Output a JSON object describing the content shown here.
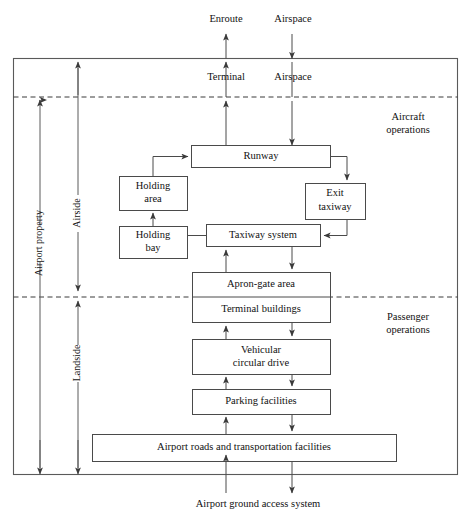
{
  "diagram": {
    "colors": {
      "line": "#4a4a4a",
      "frame": "#5a5a5a",
      "dashed": "#3a3a3a",
      "text": "#111111",
      "background": "#ffffff"
    },
    "external_labels": {
      "enroute": "Enroute",
      "airspace_top": "Airspace",
      "terminal": "Terminal",
      "airspace_terminal": "Airspace",
      "ground_access": "Airport ground access system"
    },
    "zone_labels": {
      "aircraft_operations_line1": "Aircraft",
      "aircraft_operations_line2": "operations",
      "passenger_operations_line1": "Passenger",
      "passenger_operations_line2": "operations"
    },
    "dimension_labels": {
      "airport_property": "Airport property",
      "airside": "Airside",
      "landside": "Landside"
    },
    "boxes": [
      {
        "id": "runway",
        "label": "Runway",
        "lines": [
          "Runway"
        ]
      },
      {
        "id": "holding-area",
        "label": "Holding area",
        "lines": [
          "Holding",
          "area"
        ]
      },
      {
        "id": "holding-bay",
        "label": "Holding bay",
        "lines": [
          "Holding",
          "bay"
        ]
      },
      {
        "id": "exit-taxiway",
        "label": "Exit taxiway",
        "lines": [
          "Exit",
          "taxiway"
        ]
      },
      {
        "id": "taxiway-system",
        "label": "Taxiway system",
        "lines": [
          "Taxiway system"
        ]
      },
      {
        "id": "apron-gate-area",
        "label": "Apron-gate area",
        "lines": [
          "Apron-gate area"
        ]
      },
      {
        "id": "terminal-buildings",
        "label": "Terminal buildings",
        "lines": [
          "Terminal buildings"
        ]
      },
      {
        "id": "vehicular-circular-drive",
        "label": "Vehicular circular drive",
        "lines": [
          "Vehicular",
          "circular drive"
        ]
      },
      {
        "id": "parking-facilities",
        "label": "Parking facilities",
        "lines": [
          "Parking facilities"
        ]
      },
      {
        "id": "airport-roads",
        "label": "Airport roads and transportation facilities",
        "lines": [
          "Airport roads and transportation facilities"
        ]
      }
    ]
  }
}
